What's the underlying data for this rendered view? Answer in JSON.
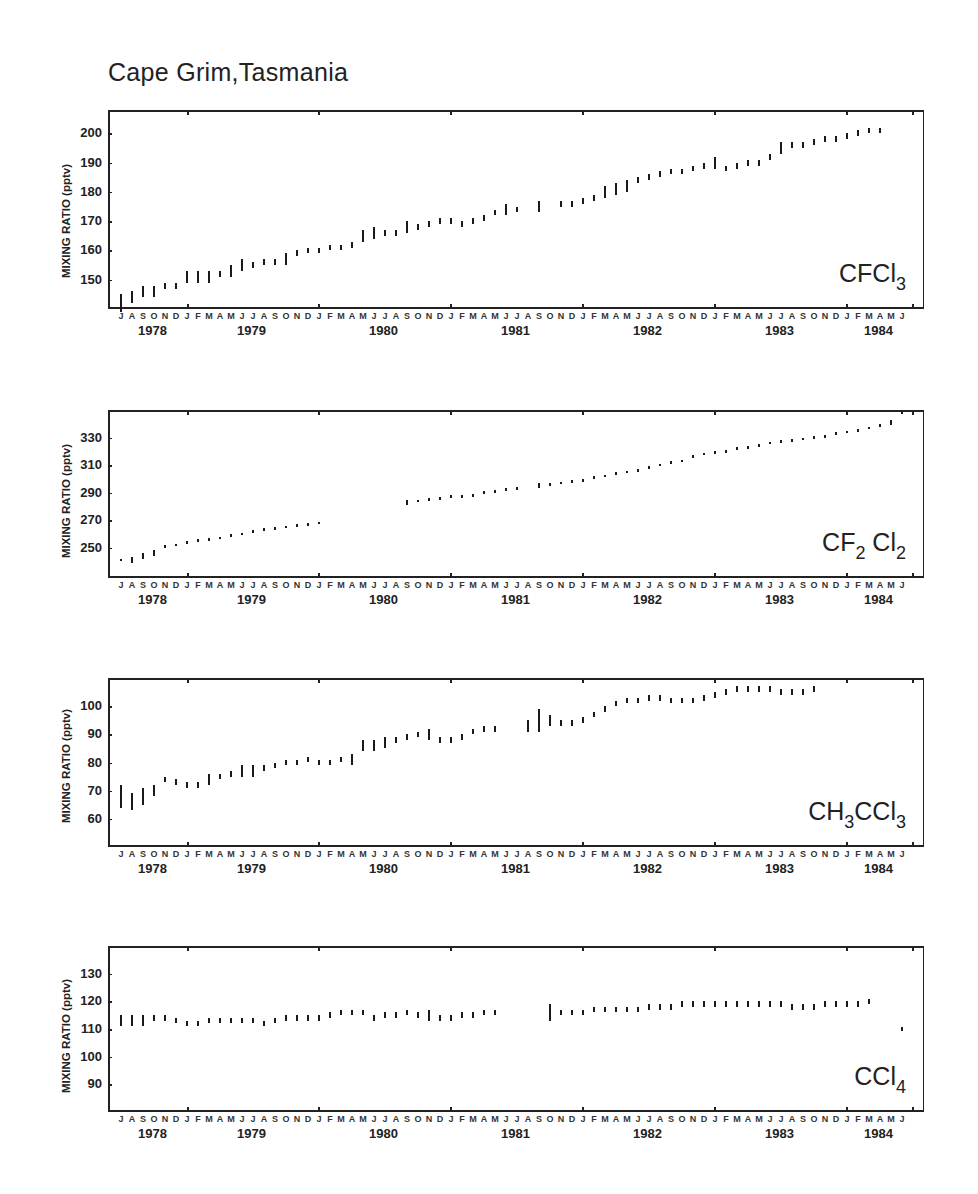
{
  "figure": {
    "title": "Cape Grim,Tasmania",
    "y_axis_label": "MIXING RATIO (pptv)",
    "month_letters": [
      "J",
      "A",
      "S",
      "O",
      "N",
      "D",
      "J",
      "F",
      "M",
      "A",
      "M",
      "J",
      "J",
      "A",
      "S",
      "O",
      "N",
      "D",
      "J",
      "F",
      "M",
      "A",
      "M",
      "J",
      "J",
      "A",
      "S",
      "O",
      "N",
      "D",
      "J",
      "F",
      "M",
      "A",
      "M",
      "J",
      "J",
      "A",
      "S",
      "O",
      "N",
      "D",
      "J",
      "F",
      "M",
      "A",
      "M",
      "J",
      "J",
      "A",
      "S",
      "O",
      "N",
      "D",
      "J",
      "F",
      "M",
      "A",
      "M",
      "J",
      "J",
      "A",
      "S",
      "O",
      "N",
      "D",
      "J",
      "F",
      "M",
      "A",
      "M",
      "J"
    ],
    "year_labels": [
      "1978",
      "1979",
      "1980",
      "1981",
      "1982",
      "1983",
      "1984"
    ]
  },
  "chart_data": [
    {
      "type": "scatter",
      "title": "CFCl3",
      "species_label": {
        "main": "CFCl",
        "sub": "3"
      },
      "xlabel": "Month (Jul 1978 - Jun 1984)",
      "ylabel": "MIXING RATIO (pptv)",
      "yticks": [
        150,
        160,
        170,
        180,
        190,
        200
      ],
      "ylim": [
        140,
        208
      ],
      "x_start": "1978-07",
      "values": [
        142,
        144,
        146,
        146,
        148,
        148,
        151,
        151,
        151,
        152,
        153,
        155,
        155,
        156,
        156,
        157,
        159,
        160,
        160,
        161,
        161,
        162,
        165,
        166,
        166,
        166,
        168,
        168,
        169,
        170,
        170,
        169,
        170,
        171,
        173,
        174,
        174,
        null,
        175,
        null,
        176,
        176,
        177,
        178,
        180,
        181,
        182,
        184,
        185,
        186,
        187,
        187,
        188,
        189,
        190,
        188,
        189,
        190,
        190,
        192,
        195,
        196,
        196,
        197,
        198,
        198,
        199,
        200,
        201,
        201,
        null,
        null
      ],
      "errors": [
        3,
        2,
        2,
        2,
        1,
        1,
        2,
        2,
        2,
        1,
        2,
        2,
        1,
        1,
        1,
        2,
        1,
        1,
        1,
        1,
        1,
        1,
        2,
        2,
        1,
        1,
        2,
        1,
        1,
        1,
        1,
        1,
        1,
        1,
        1,
        2,
        1,
        0,
        2,
        0,
        1,
        1,
        1,
        1,
        2,
        2,
        2,
        1,
        1,
        1,
        1,
        1,
        1,
        1,
        2,
        1,
        1,
        1,
        1,
        1,
        2,
        1,
        1,
        1,
        1,
        1,
        1,
        1,
        1,
        1,
        0,
        0
      ]
    },
    {
      "type": "scatter",
      "title": "CF2Cl2",
      "species_label": {
        "main": "CF",
        "sub": "2",
        "main2": " Cl",
        "sub2": "2"
      },
      "xlabel": "Month (Jul 1978 - Jun 1984)",
      "ylabel": "MIXING RATIO (pptv)",
      "yticks": [
        250,
        270,
        290,
        310,
        330
      ],
      "ylim": [
        228,
        350
      ],
      "x_start": "1978-07",
      "values": [
        241,
        241,
        244,
        246,
        251,
        252,
        254,
        255,
        256,
        257,
        259,
        260,
        262,
        263,
        264,
        265,
        266,
        267,
        268,
        null,
        null,
        null,
        null,
        null,
        null,
        null,
        283,
        284,
        285,
        286,
        287,
        287,
        288,
        290,
        291,
        292,
        293,
        null,
        295,
        296,
        297,
        298,
        299,
        301,
        302,
        304,
        305,
        306,
        308,
        310,
        312,
        313,
        316,
        318,
        319,
        320,
        322,
        323,
        324,
        326,
        327,
        328,
        329,
        330,
        331,
        333,
        334,
        335,
        337,
        339,
        341,
        348
      ],
      "errors": [
        1,
        2,
        2,
        2,
        1,
        1,
        1,
        1,
        1,
        1,
        1,
        1,
        1,
        1,
        1,
        1,
        1,
        1,
        1,
        0,
        0,
        0,
        0,
        0,
        0,
        0,
        2,
        1,
        1,
        1,
        1,
        1,
        1,
        1,
        1,
        1,
        1,
        0,
        2,
        1,
        1,
        1,
        1,
        1,
        1,
        1,
        1,
        1,
        1,
        1,
        1,
        1,
        1,
        1,
        1,
        1,
        1,
        1,
        1,
        1,
        1,
        1,
        1,
        1,
        1,
        1,
        1,
        1,
        1,
        1,
        2,
        1
      ]
    },
    {
      "type": "scatter",
      "title": "CH3CCl3",
      "species_label": {
        "main": "CH",
        "sub": "3",
        "main2": "CCl",
        "sub2": "3"
      },
      "xlabel": "Month (Jul 1978 - Jun 1984)",
      "ylabel": "MIXING RATIO (pptv)",
      "yticks": [
        60,
        70,
        80,
        90,
        100
      ],
      "ylim": [
        50,
        110
      ],
      "x_start": "1978-07",
      "values": [
        68,
        66,
        68,
        70,
        74,
        73,
        72,
        72,
        74,
        75,
        76,
        77,
        77,
        78,
        79,
        80,
        80,
        81,
        80,
        80,
        81,
        81,
        86,
        86,
        87,
        88,
        89,
        90,
        90,
        88,
        88,
        89,
        91,
        92,
        92,
        null,
        null,
        93,
        95,
        95,
        94,
        94,
        95,
        97,
        99,
        101,
        102,
        102,
        103,
        103,
        102,
        102,
        102,
        103,
        104,
        105,
        106,
        106,
        106,
        106,
        105,
        105,
        105,
        106,
        null,
        null,
        null,
        null,
        null,
        null,
        null,
        null
      ],
      "errors": [
        4,
        3,
        3,
        2,
        1,
        1,
        1,
        1,
        2,
        1,
        1,
        2,
        2,
        1,
        1,
        1,
        1,
        1,
        1,
        1,
        1,
        2,
        2,
        2,
        2,
        1,
        1,
        1,
        2,
        1,
        1,
        1,
        1,
        1,
        1,
        0,
        0,
        2,
        4,
        2,
        1,
        1,
        1,
        1,
        1,
        1,
        1,
        1,
        1,
        1,
        1,
        1,
        1,
        1,
        1,
        1,
        1,
        1,
        1,
        1,
        1,
        1,
        1,
        1,
        0,
        0,
        0,
        0,
        0,
        0,
        0,
        0
      ]
    },
    {
      "type": "scatter",
      "title": "CCl4",
      "species_label": {
        "main": "CCl",
        "sub": "4"
      },
      "xlabel": "Month (Jul 1978 - Jun 1984)",
      "ylabel": "MIXING RATIO (pptv)",
      "yticks": [
        90,
        100,
        110,
        120,
        130
      ],
      "ylim": [
        80,
        140
      ],
      "x_start": "1978-07",
      "values": [
        113,
        113,
        113,
        114,
        114,
        113,
        112,
        112,
        113,
        113,
        113,
        113,
        113,
        112,
        113,
        114,
        114,
        114,
        114,
        115,
        116,
        116,
        116,
        114,
        115,
        115,
        116,
        115,
        115,
        114,
        114,
        115,
        115,
        116,
        116,
        null,
        null,
        null,
        null,
        116,
        116,
        116,
        116,
        117,
        117,
        117,
        117,
        117,
        118,
        118,
        118,
        119,
        119,
        119,
        119,
        119,
        119,
        119,
        119,
        119,
        119,
        118,
        118,
        118,
        119,
        119,
        119,
        119,
        120,
        null,
        null,
        110
      ],
      "errors": [
        2,
        2,
        2,
        1,
        1,
        1,
        1,
        1,
        1,
        1,
        1,
        1,
        1,
        1,
        1,
        1,
        1,
        1,
        1,
        1,
        1,
        1,
        1,
        1,
        1,
        1,
        1,
        1,
        2,
        1,
        1,
        1,
        1,
        1,
        1,
        0,
        0,
        0,
        0,
        3,
        1,
        1,
        1,
        1,
        1,
        1,
        1,
        1,
        1,
        1,
        1,
        1,
        1,
        1,
        1,
        1,
        1,
        1,
        1,
        1,
        1,
        1,
        1,
        1,
        1,
        1,
        1,
        1,
        1,
        0,
        0,
        0
      ]
    }
  ],
  "layout": {
    "panels": [
      {
        "top": 110,
        "bottom": 309,
        "ylabel_top": 215
      },
      {
        "top": 410,
        "bottom": 578,
        "ylabel_top": 495
      },
      {
        "top": 678,
        "bottom": 847,
        "ylabel_top": 760
      },
      {
        "top": 946,
        "bottom": 1112,
        "ylabel_top": 1030
      }
    ],
    "plot_left": 108,
    "plot_right": 924,
    "first_month_x": 121,
    "month_px": 11.0
  }
}
